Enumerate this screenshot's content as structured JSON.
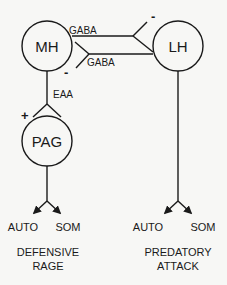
{
  "diagram": {
    "type": "neural-circuit",
    "nodes": {
      "mh": {
        "label": "MH"
      },
      "lh": {
        "label": "LH"
      },
      "pag": {
        "label": "PAG"
      }
    },
    "connections": {
      "mh_to_lh": {
        "transmitter": "GABA",
        "sign": "-"
      },
      "lh_to_mh": {
        "transmitter": "GABA",
        "sign": "-"
      },
      "mh_to_pag": {
        "transmitter": "EAA",
        "sign": "+"
      }
    },
    "outputs": {
      "left": {
        "auto": "AUTO",
        "som": "SOM",
        "title_line1": "DEFENSIVE",
        "title_line2": "RAGE"
      },
      "right": {
        "auto": "AUTO",
        "som": "SOM",
        "title_line1": "PREDATORY",
        "title_line2": "ATTACK"
      }
    },
    "colors": {
      "stroke": "#1a1a1a",
      "background": "#f7f7f5"
    }
  }
}
